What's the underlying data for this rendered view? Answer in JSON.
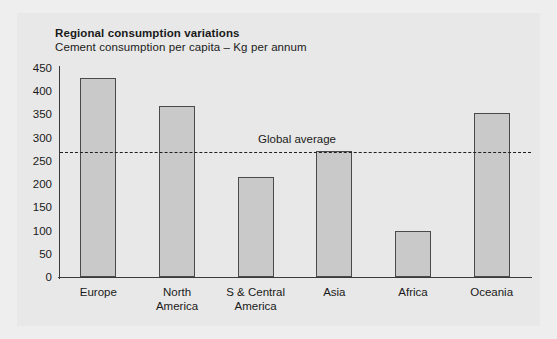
{
  "chart_data": {
    "type": "bar",
    "title": "Regional consumption variations",
    "subtitle": "Cement consumption per capita – Kg per annum",
    "xlabel": "",
    "ylabel": "",
    "categories": [
      "Europe",
      "North\nAmerica",
      "S & Central\nAmerica",
      "Asia",
      "Africa",
      "Oceania"
    ],
    "values": [
      428,
      368,
      215,
      272,
      99,
      353
    ],
    "ylim": [
      0,
      450
    ],
    "yticks": [
      0,
      50,
      100,
      150,
      200,
      250,
      300,
      350,
      400,
      450
    ],
    "grid": false,
    "legend": "none",
    "annotations": [
      {
        "name": "global-average",
        "label": "Global average",
        "value": 270,
        "style": "dashed-horizontal-line"
      }
    ],
    "colors": {
      "bar_fill": "#c9c9c9",
      "bar_stroke": "#4a4a4a",
      "axis": "#3a3a3a",
      "text": "#1a1a1a",
      "panel_background": "#e8e8e8",
      "figure_background": "#eeeeee",
      "average_line": "#1f1f1f"
    }
  }
}
